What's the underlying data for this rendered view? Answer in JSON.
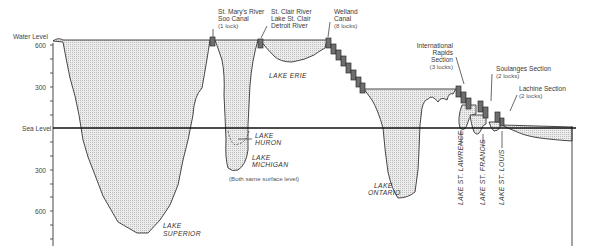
{
  "axis": {
    "top_label": "Water Level",
    "sea_label": "Sea Level",
    "ticks": [
      {
        "label": "600",
        "y": 45
      },
      {
        "label": "300",
        "y": 87
      },
      {
        "label": "300",
        "y": 170
      },
      {
        "label": "600",
        "y": 211
      }
    ]
  },
  "connectors": {
    "st_marys": {
      "line1": "St. Mary's River",
      "line2": "Soo Canal",
      "line3": "(1 lock)"
    },
    "st_clair": {
      "line1": "St. Clair River",
      "line2": "Lake St. Clair",
      "line3": "Detroit River"
    },
    "welland": {
      "line1": "Welland",
      "line2": "Canal",
      "line3": "(8 locks)"
    },
    "intl_rapids": {
      "line1": "International",
      "line2": "Rapids",
      "line3": "Section",
      "line4": "(3 locks)"
    },
    "soulanges": {
      "line1": "Soulanges Section",
      "line2": "(2 locks)"
    },
    "lachine": {
      "line1": "Lachine Section",
      "line2": "(2 locks)"
    }
  },
  "lakes": {
    "superior": {
      "line1": "LAKE",
      "line2": "SUPERIOR"
    },
    "huron": {
      "line1": "LAKE",
      "line2": "HURON"
    },
    "michigan": {
      "line1": "LAKE",
      "line2": "MICHIGAN"
    },
    "michigan_note": "(Both same surface level)",
    "erie": "LAKE  ERIE",
    "ontario": {
      "line1": "LAKE",
      "line2": "ONTARIO"
    },
    "st_lawrence": "LAKE  ST.  LAWRENCE",
    "st_francis": "LAKE  ST.  FRANCIS",
    "st_louis": "LAKE  ST.  LOUIS"
  }
}
